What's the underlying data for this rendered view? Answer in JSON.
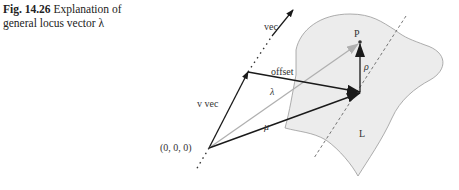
{
  "caption": {
    "number": "Fig. 14.26",
    "text_line1": "Explanation of",
    "text_line2": "general locus vector λ"
  },
  "diagram": {
    "labels": {
      "vec": "vec",
      "v_vec": "v vec",
      "offset": "offset",
      "lambda": "λ",
      "mu": "μ",
      "rho": "ρ",
      "point_p": "P",
      "origin": "(0, 0, 0)",
      "surface": "L"
    },
    "colors": {
      "surface_fill": "#ececec",
      "surface_stroke": "#999999",
      "dark_arrow": "#1a1a1a",
      "light_arrow": "#b0b0b0",
      "dashed_line": "#666666"
    }
  }
}
